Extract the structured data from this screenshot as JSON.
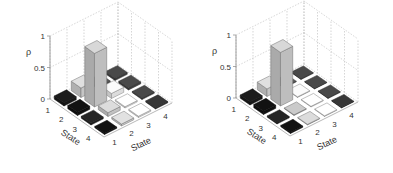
{
  "chart_data": [
    {
      "type": "bar3d",
      "title": "",
      "zlabel": "ρ",
      "xlabel": "State",
      "ylabel": "State",
      "zlim": [
        0,
        1
      ],
      "zticks": [
        "0",
        "0.5",
        "1"
      ],
      "xticks": [
        "1",
        "2",
        "3",
        "4"
      ],
      "yticks": [
        "1",
        "2",
        "3",
        "4"
      ],
      "grid": true,
      "matrix": [
        [
          0.05,
          0.15,
          0.03,
          0.03
        ],
        [
          0.05,
          0.85,
          0.08,
          0.03
        ],
        [
          0.03,
          0.06,
          0.02,
          0.02
        ],
        [
          0.02,
          0.03,
          0.02,
          0.02
        ]
      ],
      "colors": [
        [
          "#1a1a1a",
          "#cfcfcf",
          "#555555",
          "#444444"
        ],
        [
          "#111111",
          "#c8c8c8",
          "#e8e8e8",
          "#444444"
        ],
        [
          "#222222",
          "#cccccc",
          "#eeeeee",
          "#444444"
        ],
        [
          "#111111",
          "#d0d0d0",
          "#eeeeee",
          "#333333"
        ]
      ]
    },
    {
      "type": "bar3d",
      "title": "",
      "zlabel": "ρ",
      "xlabel": "State",
      "ylabel": "State",
      "zlim": [
        0,
        1
      ],
      "zticks": [
        "0",
        "0.5",
        "1"
      ],
      "xticks": [
        "1",
        "2",
        "3",
        "4"
      ],
      "yticks": [
        "1",
        "2",
        "3",
        "4"
      ],
      "grid": true,
      "matrix": [
        [
          0.05,
          0.12,
          0.01,
          0.01
        ],
        [
          0.05,
          0.85,
          0.01,
          0.01
        ],
        [
          0.02,
          0.01,
          0.01,
          0.01
        ],
        [
          0.02,
          0.01,
          0.01,
          0.01
        ]
      ],
      "colors": [
        [
          "#1a1a1a",
          "#cfcfcf",
          "#555555",
          "#444444"
        ],
        [
          "#111111",
          "#c8c8c8",
          "#e8e8e8",
          "#444444"
        ],
        [
          "#222222",
          "#bbbbbb",
          "#eeeeee",
          "#444444"
        ],
        [
          "#111111",
          "#cccccc",
          "#eeeeee",
          "#333333"
        ]
      ]
    }
  ]
}
